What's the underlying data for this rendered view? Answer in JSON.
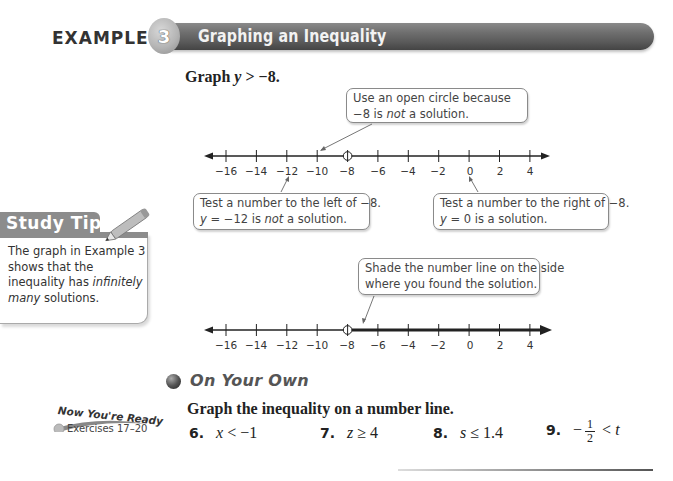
{
  "header": {
    "example_label": "EXAMPLE",
    "example_number": "3",
    "title": "Graphing an Inequality"
  },
  "problem": {
    "prompt_prefix": "Graph",
    "variable": "y",
    "prompt_rest": " > −8."
  },
  "number_line_1": {
    "min": -16,
    "max": 4,
    "step": 2,
    "tick_labels": [
      "−16",
      "−14",
      "−12",
      "−10",
      "−8",
      "−6",
      "−4",
      "−2",
      "0",
      "2",
      "4"
    ],
    "open_circle_at": "−8",
    "shaded": false
  },
  "callouts": {
    "open_circle": {
      "line1": "Use an open circle because",
      "line2_pre": "−8 is ",
      "line2_em": "not",
      "line2_post": " a solution."
    },
    "test_left": {
      "line1": "Test a number to the left of −8.",
      "line2_var": "y",
      "line2_pre": " = −12 is ",
      "line2_em": "not",
      "line2_post": " a solution."
    },
    "test_right": {
      "line1": "Test a number to the right of −8.",
      "line2_var": "y",
      "line2_post": " = 0 is a solution."
    },
    "shade": {
      "line1": "Shade the number line on the side",
      "line2": "where you found the solution."
    }
  },
  "number_line_2": {
    "min": -16,
    "max": 4,
    "step": 2,
    "tick_labels": [
      "−16",
      "−14",
      "−12",
      "−10",
      "−8",
      "−6",
      "−4",
      "−2",
      "0",
      "2",
      "4"
    ],
    "open_circle_at": "−8",
    "shaded": true,
    "shade_direction": "right"
  },
  "study_tip": {
    "heading": "Study Tip",
    "body_pre": "The graph in Example 3 shows that the inequality has ",
    "body_em": "infinitely many",
    "body_post": " solutions."
  },
  "on_your_own": {
    "title": "On Your Own",
    "instruction": "Graph the inequality on a number line.",
    "now_youre_ready": "Now You're Ready",
    "exercises_ref": "Exercises 17–20",
    "exercises": [
      {
        "number": "6.",
        "var": "x",
        "rest": " < −1"
      },
      {
        "number": "7.",
        "var": "z",
        "rest": " ≥ 4"
      },
      {
        "number": "8.",
        "var": "s",
        "rest": " ≤ 1.4"
      },
      {
        "number": "9.",
        "prefix": "−",
        "frac_num": "1",
        "frac_den": "2",
        "mid": " < ",
        "var": "t"
      }
    ]
  },
  "colors": {
    "banner": "#6f6f6f",
    "study_tip_head": "#8c8c8c",
    "callout_border": "#8a8a8a",
    "text": "#222222"
  }
}
